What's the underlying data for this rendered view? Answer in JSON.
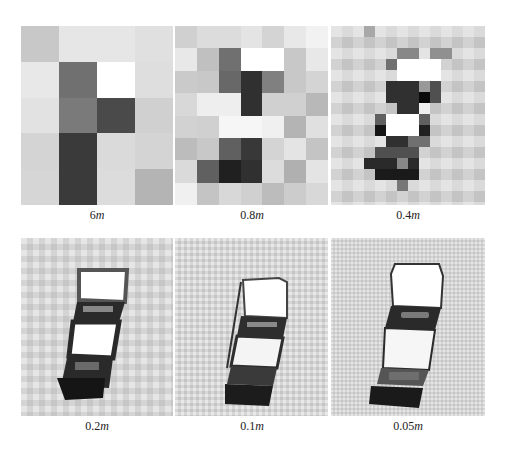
{
  "figure": {
    "panels": [
      {
        "id": "p6m",
        "resolution_value": "6",
        "resolution_unit": "m",
        "caption": "6m",
        "grid": {
          "cols": 4,
          "rows": 5,
          "cells": [
            "#c8c8c8",
            "#e6e6e6",
            "#e6e6e6",
            "#e0e0e0",
            "#e8e8e8",
            "#707070",
            "#ffffff",
            "#dedede",
            "#e2e2e2",
            "#7a7a7a",
            "#4a4a4a",
            "#d0d0d0",
            "#d4d4d4",
            "#3a3a3a",
            "#dadada",
            "#d4d4d4",
            "#d6d6d6",
            "#3a3a3a",
            "#dcdcdc",
            "#b4b4b4"
          ]
        }
      },
      {
        "id": "p08m",
        "resolution_value": "0.8",
        "resolution_unit": "m",
        "caption": "0.8m",
        "grid": {
          "cols": 7,
          "rows": 8,
          "cells": [
            "#d0d0d0",
            "#dcdcdc",
            "#dcdcdc",
            "#e4e4e4",
            "#d4d4d4",
            "#e8e8e8",
            "#f2f2f2",
            "#e8e8e8",
            "#c0c0c0",
            "#707070",
            "#ffffff",
            "#ffffff",
            "#c8c8c8",
            "#e8e8e8",
            "#cacaca",
            "#c8c8c8",
            "#686868",
            "#303030",
            "#808080",
            "#c8c8c8",
            "#d4d4d4",
            "#d8d8d8",
            "#eeeeee",
            "#eeeeee",
            "#303030",
            "#d0d0d0",
            "#d0d0d0",
            "#b8b8b8",
            "#d2d2d2",
            "#d0d0d0",
            "#f6f6f6",
            "#f6f6f6",
            "#f0f0f0",
            "#b4b4b4",
            "#e0e0e0",
            "#bcbcbc",
            "#c8c8c8",
            "#606060",
            "#383838",
            "#d4d4d4",
            "#e4e4e4",
            "#c4c4c4",
            "#dadada",
            "#606060",
            "#202020",
            "#303030",
            "#dcdcdc",
            "#b0b0b0",
            "#e4e4e4",
            "#f0f0f0",
            "#c4c4c4",
            "#d8d8d8",
            "#d0d0d0",
            "#bcbcbc",
            "#cccccc",
            "#d8d8d8"
          ]
        }
      },
      {
        "id": "p04m",
        "resolution_value": "0.4",
        "resolution_unit": "m",
        "caption": "0.4m"
      },
      {
        "id": "p02m",
        "resolution_value": "0.2",
        "resolution_unit": "m",
        "caption": "0.2m"
      },
      {
        "id": "p01m",
        "resolution_value": "0.1",
        "resolution_unit": "m",
        "caption": "0.1m"
      },
      {
        "id": "p005m",
        "resolution_value": "0.05",
        "resolution_unit": "m",
        "caption": "0.05m"
      }
    ],
    "colors": {
      "background": "#ffffff",
      "ground": "#d2d2d2",
      "car_roof": "#ffffff",
      "car_dark": "#2a2a2a"
    }
  }
}
